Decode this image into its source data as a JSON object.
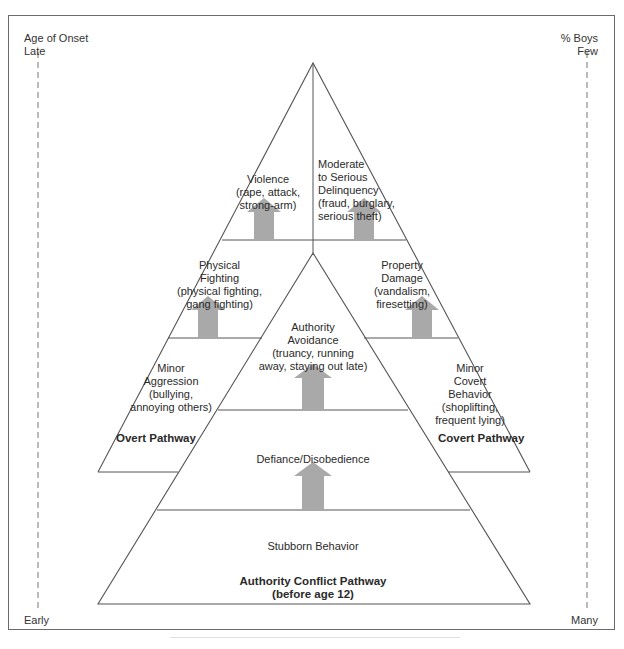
{
  "left_axis": {
    "title": "Age of Onset",
    "top_label": "Late",
    "bottom_label": "Early"
  },
  "right_axis": {
    "title": "% Boys",
    "top_label": "Few",
    "bottom_label": "Many"
  },
  "pathways": {
    "overt": {
      "name": "Overt Pathway",
      "levels": [
        {
          "title": "Violence",
          "examples": [
            "(rape, attack,",
            "strong-arm)"
          ]
        },
        {
          "title": "Physical",
          "title2": "Fighting",
          "examples": [
            "(physical fighting,",
            "gang fighting)"
          ]
        },
        {
          "title": "Minor",
          "title2": "Aggression",
          "examples": [
            "(bullying,",
            "annoying others)"
          ]
        }
      ]
    },
    "covert": {
      "name": "Covert Pathway",
      "levels": [
        {
          "title": "Moderate",
          "title2": "to Serious",
          "title3": "Delinquency",
          "examples": [
            "(fraud, burglary,",
            "serious theft)"
          ]
        },
        {
          "title": "Property",
          "title2": "Damage",
          "examples": [
            "(vandalism,",
            "firesetting)"
          ]
        },
        {
          "title": "Minor",
          "title2": "Covert",
          "title3": "Behavior",
          "examples": [
            "(shoplifting,",
            "frequent lying)"
          ]
        }
      ]
    },
    "authority_conflict": {
      "name": "Authority Conflict Pathway",
      "subtitle": "(before age 12)",
      "levels": [
        {
          "title": "Authority",
          "title2": "Avoidance",
          "examples": [
            "(truancy, running",
            "away, staying out late)"
          ]
        },
        {
          "title": "Defiance/Disobedience"
        },
        {
          "title": "Stubborn Behavior"
        }
      ]
    }
  },
  "colors": {
    "line": "#555555",
    "arrow": "#a9a9a9",
    "frame": "#6a6a6a",
    "text": "#2a2a2a"
  }
}
